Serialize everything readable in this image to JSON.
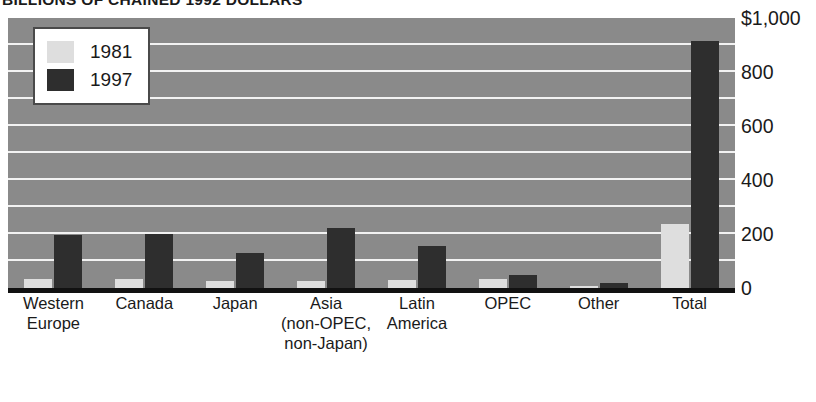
{
  "chart_data": {
    "type": "bar",
    "title": "BILLIONS OF CHAINED 1992 DOLLARS",
    "xlabel": "",
    "ylabel": "",
    "ylim": [
      0,
      1000
    ],
    "ytick_values": [
      1000,
      800,
      600,
      400,
      200,
      0
    ],
    "ytick_labels": [
      "$1,000",
      "800",
      "600",
      "400",
      "200",
      "0"
    ],
    "grid": true,
    "grid_interval": 100,
    "legend_position": "top-left",
    "categories": [
      "Western Europe",
      "Canada",
      "Japan",
      "Asia (non-OPEC, non-Japan)",
      "Latin America",
      "OPEC",
      "Other",
      "Total"
    ],
    "category_lines": [
      [
        "Western",
        "Europe"
      ],
      [
        "Canada"
      ],
      [
        "Japan"
      ],
      [
        "Asia",
        "(non-OPEC,",
        "non-Japan)"
      ],
      [
        "Latin",
        "America"
      ],
      [
        "OPEC"
      ],
      [
        "Other"
      ],
      [
        "Total"
      ]
    ],
    "series": [
      {
        "name": "1981",
        "color": "#dedede",
        "values": [
          33,
          33,
          26,
          26,
          30,
          33,
          7,
          237
        ]
      },
      {
        "name": "1997",
        "color": "#2e2e2e",
        "values": [
          196,
          200,
          130,
          222,
          156,
          48,
          18,
          915
        ]
      }
    ],
    "colors": {
      "plot_background": "#8a8a8a",
      "gridline": "#f2f2f2",
      "axis": "#111111",
      "text": "#1a1a1a",
      "series_1981": "#dedede",
      "series_1997": "#2e2e2e"
    }
  },
  "legend": {
    "entries": [
      {
        "label": "1981",
        "swatch_name": "legend-swatch-1981"
      },
      {
        "label": "1997",
        "swatch_name": "legend-swatch-1997"
      }
    ]
  }
}
